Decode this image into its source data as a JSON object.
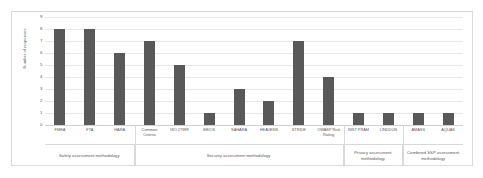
{
  "chart_data": {
    "type": "bar",
    "title": "",
    "xlabel": "",
    "ylabel": "Number of responses",
    "ylim": [
      0,
      9
    ],
    "yticks": [
      0,
      1,
      2,
      3,
      4,
      5,
      6,
      7,
      8,
      9
    ],
    "grid": true,
    "legend": "none",
    "bar_color": "#595959",
    "categories": [
      "FMEA",
      "FTA",
      "HARA",
      "Common Criteria",
      "ISO 27999",
      "EBIOS",
      "SAHARA",
      "HEAVENS",
      "STRIDE",
      "OWASP Risk Rating",
      "NIST PRAM",
      "LINDDUN",
      "AMASS",
      "AQUAS"
    ],
    "values": [
      8,
      8,
      6,
      7,
      5,
      1,
      3,
      2,
      7,
      4,
      1,
      1,
      1,
      1
    ],
    "groups": [
      {
        "label": "Safety assessment methodology",
        "span": 3
      },
      {
        "label": "Security assessment methodology",
        "span": 7
      },
      {
        "label": "Privacy assessment methodology",
        "span": 2
      },
      {
        "label": "Combined SSP assessment methodology",
        "span": 2
      }
    ]
  }
}
